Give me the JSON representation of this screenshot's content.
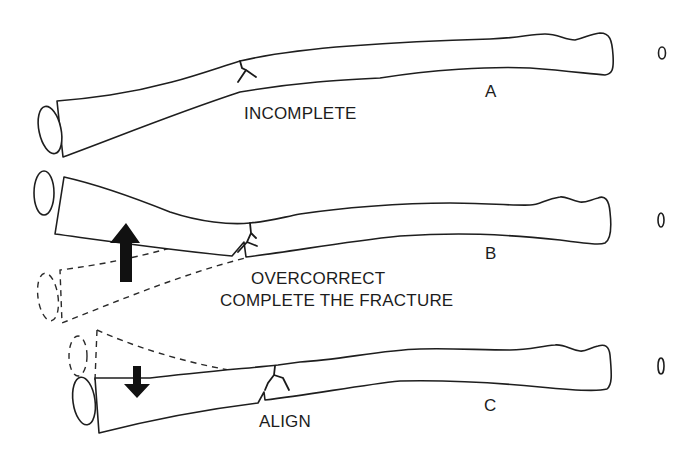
{
  "figure": {
    "panels": [
      {
        "id": "A",
        "letter": "A",
        "caption_lines": [
          "INCOMPLETE"
        ]
      },
      {
        "id": "B",
        "letter": "B",
        "caption_lines": [
          "OVERCORRECT",
          "COMPLETE THE FRACTURE"
        ]
      },
      {
        "id": "C",
        "letter": "C",
        "caption_lines": [
          "ALIGN"
        ]
      }
    ],
    "colors": {
      "line": "#1e1e1e",
      "background": "#ffffff",
      "arrow": "#111111"
    }
  }
}
